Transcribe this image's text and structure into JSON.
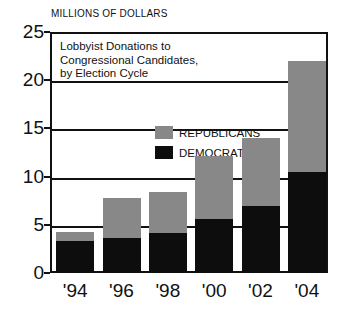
{
  "chart_data": {
    "type": "bar",
    "stacked": true,
    "title": "Lobbyist Donations to Congressional Candidates, by Election Cycle",
    "title_lines": [
      "Lobbyist Donations to",
      "Congressional Candidates,",
      "by Election Cycle"
    ],
    "units_label": "MILLIONS OF DOLLARS",
    "xlabel": "",
    "ylabel": "",
    "categories": [
      "'94",
      "'96",
      "'98",
      "'00",
      "'02",
      "'04"
    ],
    "ylim": [
      0,
      25
    ],
    "yticks": [
      0,
      5,
      10,
      15,
      20,
      25
    ],
    "ytick_labels": [
      "0",
      "5",
      "10",
      "15",
      "20",
      "25"
    ],
    "grid": true,
    "legend_position": "inside-top-center",
    "series": [
      {
        "name": "DEMOCRATS",
        "color": "#0d0d0d",
        "values": [
          3.3,
          3.6,
          4.2,
          5.6,
          7.0,
          10.5
        ]
      },
      {
        "name": "REPUBLICANS",
        "color": "#888888",
        "values": [
          1.0,
          4.2,
          4.2,
          6.5,
          7.0,
          11.5
        ]
      }
    ],
    "totals": [
      4.3,
      7.8,
      8.4,
      12.1,
      14.0,
      22.0
    ]
  },
  "legend": {
    "items": [
      {
        "label": "REPUBLICANS",
        "color": "#888888"
      },
      {
        "label": "DEMOCRATS",
        "color": "#0d0d0d"
      }
    ]
  },
  "colors": {
    "republican": "#888888",
    "democrat": "#0d0d0d",
    "axis": "#111111",
    "background": "#ffffff"
  }
}
